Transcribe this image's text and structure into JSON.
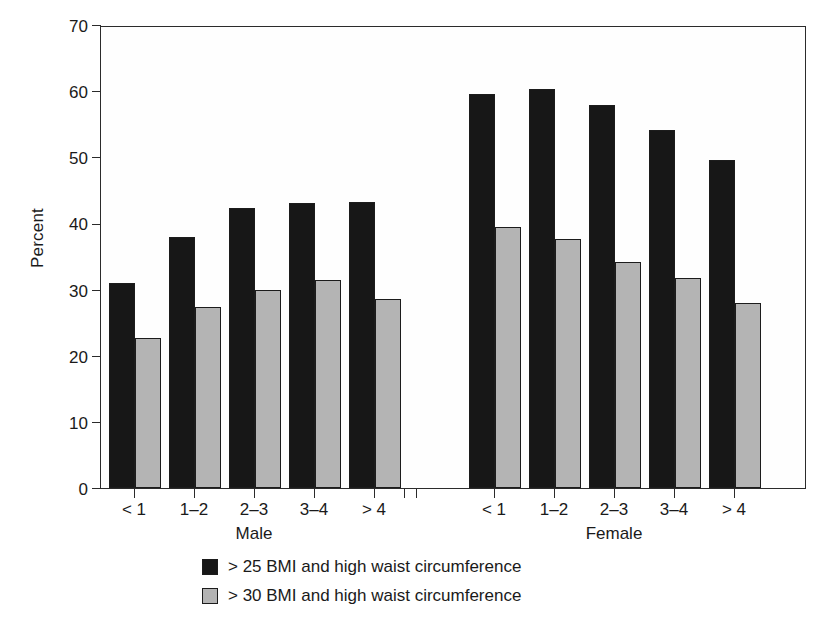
{
  "chart_data": {
    "type": "bar",
    "title": "",
    "xlabel": "",
    "ylabel": "Percent",
    "ylim": [
      0,
      70
    ],
    "yticks": [
      0,
      10,
      20,
      30,
      40,
      50,
      60,
      70
    ],
    "grid": false,
    "legend_position": "bottom-center",
    "categories": [
      "< 1",
      "1–2",
      "2–3",
      "3–4",
      "> 4"
    ],
    "groups": [
      {
        "name": "Male",
        "categories": [
          "< 1",
          "1–2",
          "2–3",
          "3–4",
          "> 4"
        ],
        "series": [
          {
            "name": "> 25 BMI and high waist circumference",
            "values": [
              31.0,
              38.0,
              42.3,
              43.1,
              43.2
            ]
          },
          {
            "name": "> 30 BMI and high waist circumference",
            "values": [
              22.7,
              27.3,
              30.0,
              31.4,
              28.6
            ]
          }
        ]
      },
      {
        "name": "Female",
        "categories": [
          "< 1",
          "1–2",
          "2–3",
          "3–4",
          "> 4"
        ],
        "series": [
          {
            "name": "> 25 BMI and high waist circumference",
            "values": [
              59.5,
              60.4,
              57.9,
              54.1,
              49.6
            ]
          },
          {
            "name": "> 30 BMI and high waist circumference",
            "values": [
              39.4,
              37.7,
              34.1,
              31.7,
              28.0
            ]
          }
        ]
      }
    ],
    "legend": [
      {
        "label": "> 25 BMI and high waist circumference",
        "color": "#171717",
        "swatch": "dark"
      },
      {
        "label": "> 30 BMI and high waist circumference",
        "color": "#b4b4b4",
        "swatch": "light"
      }
    ],
    "colors": {
      "series_dark": "#171717",
      "series_light": "#b4b4b4",
      "axis": "#2b2b2b",
      "background": "#ffffff"
    }
  }
}
